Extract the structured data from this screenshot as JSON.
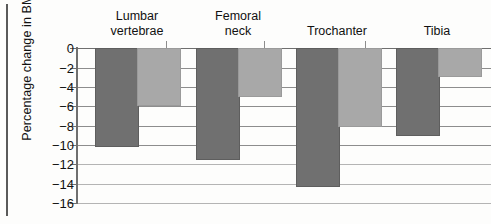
{
  "chart_data": {
    "type": "bar",
    "title": "",
    "subtitle": "",
    "xlabel": "",
    "ylabel": "Percentage change in BMD",
    "categories": [
      "Lumbar vertebrae",
      "Femoral neck",
      "Trochanter",
      "Tibia"
    ],
    "series": [
      {
        "name": "dark-series",
        "color": "#707070",
        "values": [
          -10.0,
          -11.4,
          -14.1,
          -8.9
        ]
      },
      {
        "name": "light-series",
        "color": "#a8a8a8",
        "values": [
          -5.8,
          -4.8,
          -7.9,
          -2.8
        ]
      }
    ],
    "ylim": [
      -16,
      0
    ],
    "ytick_values": [
      0,
      -2,
      -4,
      -6,
      -8,
      -10,
      -12,
      -14,
      -16
    ],
    "ytick_labels": [
      "0",
      "−2",
      "−4",
      "−6",
      "−8",
      "−10",
      "−12",
      "−14",
      "−16"
    ],
    "grid": true,
    "grid_orientation": "horizontal",
    "legend": false,
    "legend_position": "none"
  },
  "axis": {
    "y_title": "Percentage change in BMD"
  },
  "groups": [
    {
      "label_line1": "Lumbar",
      "label_line2": "vertebrae"
    },
    {
      "label_line1": "Femoral",
      "label_line2": "neck"
    },
    {
      "label_line1": "Trochanter",
      "label_line2": ""
    },
    {
      "label_line1": "Tibia",
      "label_line2": ""
    }
  ],
  "ticks": [
    {
      "label": "0"
    },
    {
      "label": "−2"
    },
    {
      "label": "−4"
    },
    {
      "label": "−6"
    },
    {
      "label": "−8"
    },
    {
      "label": "−10"
    },
    {
      "label": "−12"
    },
    {
      "label": "−14"
    },
    {
      "label": "−16"
    }
  ]
}
